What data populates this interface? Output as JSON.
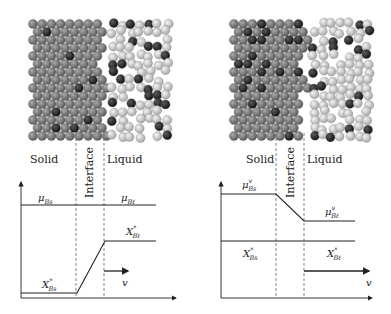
{
  "panels": [
    {
      "id": "left",
      "regions": {
        "solid": "Solid",
        "interface": "Interface",
        "liquid": "Liquid"
      },
      "curves": {
        "mu_solid": {
          "base": "μ",
          "sub": "Bs",
          "sup": ""
        },
        "mu_liquid": {
          "base": "μ",
          "sub": "Bℓ",
          "sup": ""
        },
        "x_solid": {
          "base": "X",
          "sub": "Bs",
          "sup": "*"
        },
        "x_liquid": {
          "base": "X",
          "sub": "Bℓ",
          "sup": "*"
        }
      },
      "velocity_label": "v",
      "description": "Chemical potential constant across interface; concentration rises from X*Bs to X*Bℓ"
    },
    {
      "id": "right",
      "regions": {
        "solid": "Solid",
        "interface": "Interface",
        "liquid": "Liquid"
      },
      "curves": {
        "mu_solid": {
          "base": "μ",
          "sub": "Bs",
          "sup": "v"
        },
        "mu_liquid": {
          "base": "μ",
          "sub": "Bℓ",
          "sup": "v"
        },
        "x_solid": {
          "base": "X",
          "sub": "Bs",
          "sup": "*"
        },
        "x_liquid": {
          "base": "X",
          "sub": "Bℓ",
          "sup": "*"
        }
      },
      "velocity_label": "v",
      "description": "Chemical potential drops across interface; concentration constant"
    }
  ],
  "colors": {
    "solid_atom": "#7a7a7a",
    "solute_atom": "#2a2a2a",
    "liquid_atom": "#cfcfcf",
    "line": "#222222",
    "dash": "#666666"
  }
}
